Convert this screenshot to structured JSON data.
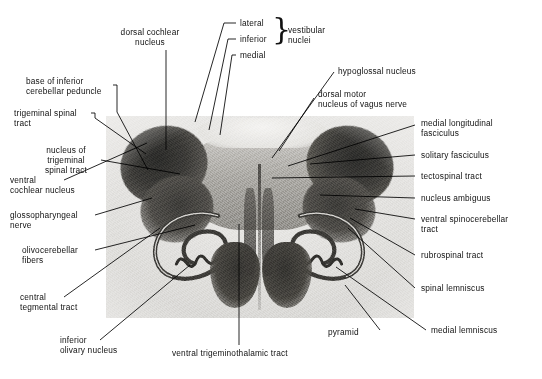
{
  "figure": {
    "specimen_name": "medulla-oblongata-cross-section-photomicrograph"
  },
  "labels": {
    "dorsal_cochlear_nucleus": "dorsal cochlear\nnucleus",
    "lateral": "lateral",
    "inferior": "inferior",
    "medial": "medial",
    "vestibular_nuclei": "vestibular\nnuclei",
    "hypoglossal_nucleus": "hypoglossal nucleus",
    "dorsal_motor_nucleus_of_vagus_nerve": "dorsal motor\nnucleus of vagus nerve",
    "base_of_inferior_cerebellar_peduncle": "base of inferior\ncerebellar peduncle",
    "trigeminal_spinal_tract": "trigeminal spinal\ntract",
    "nucleus_of_trigeminal_spinal_tract": "nucleus of\ntrigeminal\nspinal tract",
    "ventral_cochlear_nucleus": "ventral\ncochlear nucleus",
    "glossopharyngeal_nerve": "glossopharyngeal\nnerve",
    "olivocerebellar_fibers": "olivocerebellar\nfibers",
    "central_tegmental_tract": "central\ntegmental tract",
    "inferior_olivary_nucleus": "inferior\nolivary nucleus",
    "ventral_trigeminothalamic_tract": "ventral trigeminothalamic tract",
    "pyramid": "pyramid",
    "medial_lemniscus": "medial lemniscus",
    "spinal_lemniscus": "spinal lemniscus",
    "rubrospinal_tract": "rubrospinal tract",
    "ventral_spinocerebellar_tract": "ventral spinocerebellar\ntract",
    "nucleus_ambiguus": "nucleus ambiguus",
    "tectospinal_tract": "tectospinal tract",
    "solitary_fasciculus": "solitary fasciculus",
    "medial_longitudinal_fasciculus": "medial longitudinal\nfasciculus"
  },
  "brace": {
    "glyph": "}"
  },
  "colors": {
    "text": "#111111",
    "leader_line": "#000000",
    "page_background": "#ffffff",
    "plate_background": "#e8e7e4"
  }
}
